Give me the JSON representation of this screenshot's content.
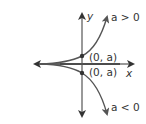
{
  "diagram": {
    "axes": {
      "x_label": "x",
      "y_label": "y"
    },
    "curves": [
      {
        "name": "upper-curve",
        "condition": "a > 0",
        "intercept_label": "(0, a)"
      },
      {
        "name": "lower-curve",
        "condition": "a < 0",
        "intercept_label": "(0, a)"
      }
    ],
    "colors": {
      "axis": "#333333",
      "curve": "#555555",
      "text": "#333333"
    }
  }
}
